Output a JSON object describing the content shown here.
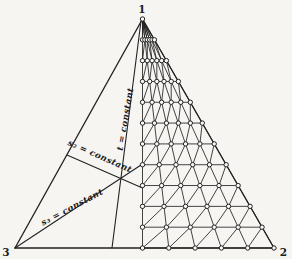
{
  "figure": {
    "background": "#f6f5f2",
    "ink": "#222222",
    "node_fill": "#f9f8f6",
    "width": 292,
    "height": 259,
    "vertices": [
      {
        "id": "1",
        "label": "1",
        "x": 142.5,
        "y": 19,
        "label_x": 142,
        "label_y": 8.5
      },
      {
        "id": "2",
        "label": "2",
        "x": 274,
        "y": 248,
        "label_x": 283.5,
        "label_y": 251.5
      },
      {
        "id": "3",
        "label": "3",
        "x": 15,
        "y": 248,
        "label_x": 6,
        "label_y": 252
      }
    ],
    "mesh": {
      "columns": 5,
      "rows": 11,
      "node_radius": 2.2,
      "line_width": 0.85,
      "region": "between median from vertex 1 and edge 1-2"
    },
    "coordinate_lines": [
      {
        "id": "t",
        "label": "t = constant",
        "x1": 141,
        "y1": 21,
        "x2": 112,
        "y2": 248,
        "label_x": 125,
        "label_y": 119,
        "label_rotation": -80
      },
      {
        "id": "s2",
        "label": "s₂ = constant",
        "x1": 67,
        "y1": 155,
        "x2": 142.5,
        "y2": 188,
        "label_x": 100,
        "label_y": 156,
        "label_rotation": 24
      },
      {
        "id": "s3",
        "label": "s₃ = constant",
        "x1": 15,
        "y1": 248,
        "x2": 142.5,
        "y2": 164,
        "label_x": 72,
        "label_y": 207,
        "label_rotation": -28
      }
    ]
  }
}
